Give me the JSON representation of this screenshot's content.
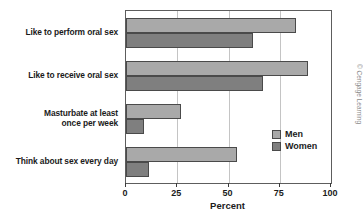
{
  "chart_data": {
    "type": "bar",
    "orientation": "horizontal",
    "title": "",
    "xlabel": "Percent",
    "ylabel": "",
    "xlim": [
      0,
      100
    ],
    "xticks": [
      "0",
      "25",
      "50",
      "75",
      "100"
    ],
    "grid": true,
    "legend_position": "inside-right",
    "categories": [
      "Like to perform oral sex",
      "Like to receive oral sex",
      "Masturbate at least once per week",
      "Think about sex every day"
    ],
    "category_lines": [
      [
        "Like to perform oral sex"
      ],
      [
        "Like to receive oral sex"
      ],
      [
        "Masturbate at least",
        "once per week"
      ],
      [
        "Think about sex every day"
      ]
    ],
    "series": [
      {
        "name": "Men",
        "color": "#a9a9a9",
        "values": [
          83,
          89,
          27,
          54
        ]
      },
      {
        "name": "Women",
        "color": "#7f7f7f",
        "values": [
          62,
          67,
          9,
          11
        ]
      }
    ]
  },
  "credit": "© Cengage Learning"
}
